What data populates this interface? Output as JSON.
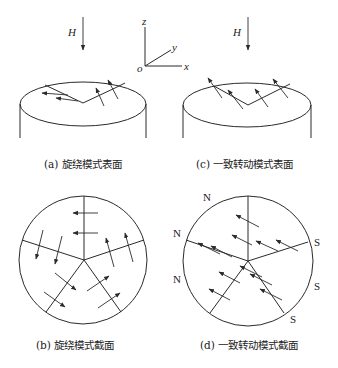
{
  "axes": {
    "z": "z",
    "y": "y",
    "x": "x",
    "o": "o"
  },
  "field_label": "H",
  "panels": {
    "a": {
      "caption": "(a) 旋绕模式表面"
    },
    "b": {
      "caption": "(b) 旋绕模式截面"
    },
    "c": {
      "caption": "(c) 一致转动模式表面"
    },
    "d": {
      "caption": "(d) 一致转动模式截面"
    }
  },
  "poles": {
    "north": [
      "N",
      "N",
      "N"
    ],
    "south": [
      "S",
      "S",
      "S"
    ]
  },
  "colors": {
    "ink": "#2a2a2a",
    "background": "#ffffff"
  }
}
